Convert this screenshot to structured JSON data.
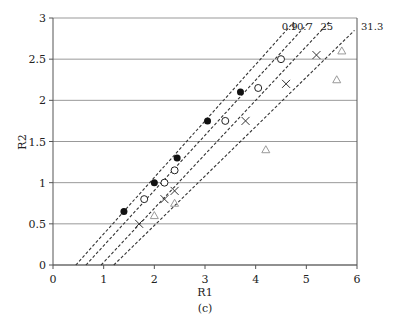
{
  "chart_data": {
    "type": "scatter",
    "title": "",
    "caption": "(c)",
    "xlabel": "R1",
    "ylabel": "R2",
    "xlim": [
      0,
      6
    ],
    "ylim": [
      0,
      3
    ],
    "xticks": [
      "0",
      "1",
      "2",
      "3",
      "4",
      "5",
      "6"
    ],
    "yticks": [
      "0",
      "0.5",
      "1",
      "1.5",
      "2",
      "2.5",
      "3"
    ],
    "grid": "horizontal",
    "lines": [
      {
        "label": "0.9",
        "x": [
          0.45,
          4.75
        ],
        "y": [
          0,
          2.95
        ]
      },
      {
        "label": "10.7",
        "x": [
          0.65,
          5.05
        ],
        "y": [
          0,
          2.95
        ]
      },
      {
        "label": "25",
        "x": [
          0.95,
          5.45
        ],
        "y": [
          0,
          2.95
        ]
      },
      {
        "label": "31.3",
        "x": [
          1.2,
          5.95
        ],
        "y": [
          0,
          2.85
        ]
      }
    ],
    "series": [
      {
        "name": "filled-circle",
        "marker": "filled-circle",
        "x": [
          1.4,
          2.0,
          2.45,
          3.05,
          3.7
        ],
        "y": [
          0.65,
          1.0,
          1.3,
          1.75,
          2.1
        ]
      },
      {
        "name": "open-circle",
        "marker": "open-circle",
        "x": [
          1.8,
          2.2,
          2.4,
          3.4,
          4.05,
          4.5
        ],
        "y": [
          0.8,
          1.0,
          1.15,
          1.75,
          2.15,
          2.5
        ]
      },
      {
        "name": "cross",
        "marker": "cross",
        "x": [
          1.7,
          2.2,
          2.4,
          3.8,
          4.6,
          5.2
        ],
        "y": [
          0.5,
          0.8,
          0.9,
          1.75,
          2.2,
          2.55
        ]
      },
      {
        "name": "triangle",
        "marker": "open-triangle",
        "x": [
          2.0,
          2.4,
          4.2,
          5.6,
          5.7
        ],
        "y": [
          0.6,
          0.75,
          1.4,
          2.25,
          2.6
        ]
      }
    ]
  }
}
